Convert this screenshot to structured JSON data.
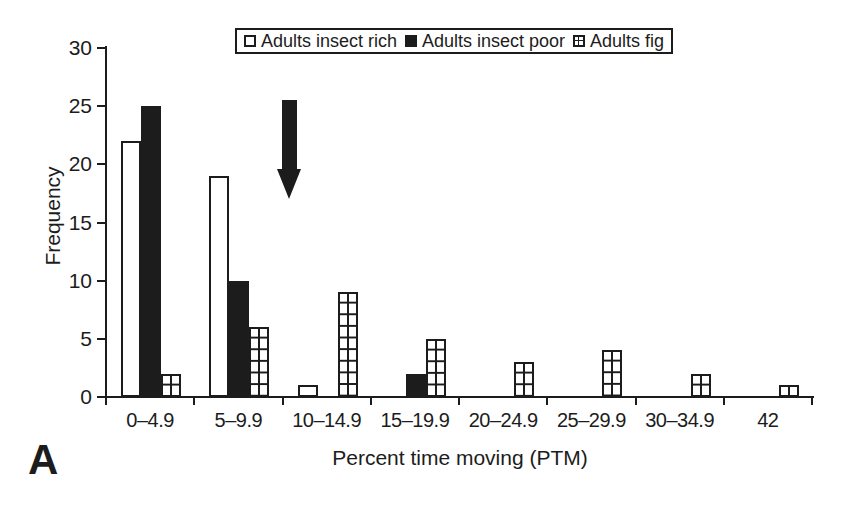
{
  "figure": {
    "panel_label": "A"
  },
  "colors": {
    "ink": "#1c1c1c",
    "background": "#ffffff"
  },
  "chart_data": {
    "type": "bar",
    "title": "",
    "xlabel": "Percent time moving (PTM)",
    "ylabel": "Frequency",
    "ylim": [
      0,
      30
    ],
    "yticks": [
      0,
      5,
      10,
      15,
      20,
      25,
      30
    ],
    "grid": false,
    "legend_position": "top-center",
    "categories": [
      "0–4.9",
      "5–9.9",
      "10–14.9",
      "15–19.9",
      "20–24.9",
      "25–29.9",
      "30–34.9",
      "42"
    ],
    "series": [
      {
        "name": "Adults insect rich",
        "style": "open",
        "color": "#ffffff",
        "values": [
          22,
          19,
          1,
          0,
          0,
          0,
          0,
          0
        ]
      },
      {
        "name": "Adults insect poor",
        "style": "solid",
        "color": "#1c1c1c",
        "values": [
          25,
          10,
          0,
          2,
          0,
          0,
          0,
          0
        ]
      },
      {
        "name": "Adults fig",
        "style": "grid",
        "color": "#ffffff",
        "values": [
          2,
          6,
          9,
          5,
          3,
          4,
          2,
          1
        ]
      }
    ],
    "annotations": [
      {
        "type": "arrow",
        "direction": "down",
        "x_between": [
          "5–9.9",
          "10–14.9"
        ],
        "y_tip_frequency": 17
      }
    ]
  }
}
